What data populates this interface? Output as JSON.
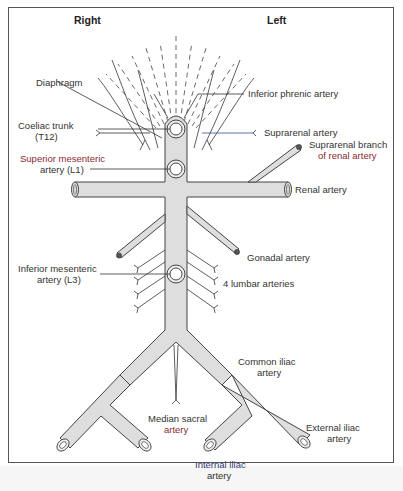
{
  "figure": {
    "side_labels": {
      "right": "Right",
      "left": "Left"
    },
    "labels": {
      "diaphragm": "Diaphragm",
      "inferior_phrenic": "Inferior phrenic artery",
      "coeliac_line1": "Coeliac trunk",
      "coeliac_line2": "(T12)",
      "suprarenal": "Suprarenal artery",
      "suprarenal_branch_line1": "Suprarenal branch",
      "suprarenal_branch_line2": "of renal artery",
      "sma_line1": "Superior mesenteric",
      "sma_line2": "artery (L1)",
      "renal": "Renal artery",
      "gonadal": "Gonadal artery",
      "ima_line1": "Inferior mesenteric",
      "ima_line2": "artery (L3)",
      "lumbar": "4 lumbar arteries",
      "common_iliac_line1": "Common iliac",
      "common_iliac_line2": "artery",
      "median_sacral_line1": "Median sacral",
      "median_sacral_line2": "artery",
      "external_iliac_line1": "External iliac",
      "external_iliac_line2": "artery",
      "internal_iliac_line1": "Internal iliac",
      "internal_iliac_line2": "artery"
    },
    "colors": {
      "vessel_fill": "#dedede",
      "outline": "#444444",
      "accent_red": "#8a2a33",
      "accent_blue": "#2e3a70"
    }
  }
}
